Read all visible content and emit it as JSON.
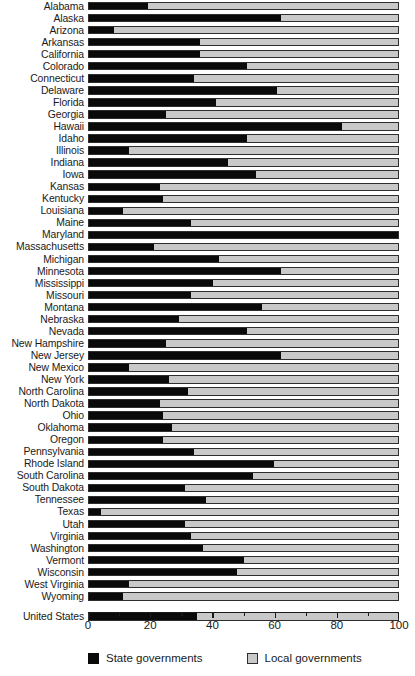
{
  "chart_data": {
    "type": "bar",
    "subtype": "stacked-horizontal-100percent",
    "title": "",
    "xlabel": "",
    "ylabel": "",
    "xlim": [
      0,
      100
    ],
    "xticks": [
      0,
      20,
      40,
      60,
      80,
      100
    ],
    "xticklabels": [
      "0",
      "20",
      "40",
      "60",
      "80",
      "100"
    ],
    "minor_ticks": [
      10,
      30,
      50,
      70,
      90
    ],
    "grid": false,
    "legend_position": "bottom",
    "categories": [
      "Alabama",
      "Alaska",
      "Arizona",
      "Arkansas",
      "California",
      "Colorado",
      "Connecticut",
      "Delaware",
      "Florida",
      "Georgia",
      "Hawaii",
      "Idaho",
      "Illinois",
      "Indiana",
      "Iowa",
      "Kansas",
      "Kentucky",
      "Louisiana",
      "Maine",
      "Maryland",
      "Massachusetts",
      "Michigan",
      "Minnesota",
      "Mississippi",
      "Missouri",
      "Montana",
      "Nebraska",
      "Nevada",
      "New Hampshire",
      "New Jersey",
      "New Mexico",
      "New York",
      "North Carolina",
      "North Dakota",
      "Ohio",
      "Oklahoma",
      "Oregon",
      "Pennsylvania",
      "Rhode Island",
      "South Carolina",
      "South Dakota",
      "Tennessee",
      "Texas",
      "Utah",
      "Virginia",
      "Washington",
      "Vermont",
      "Wisconsin",
      "West Virginia",
      "Wyoming",
      "United States"
    ],
    "series": [
      {
        "name": "State governments",
        "color": "#0a0a0a",
        "values": [
          19,
          62,
          8,
          36,
          36,
          51,
          34,
          61,
          41,
          25,
          82,
          51,
          13,
          45,
          54,
          23,
          24,
          11,
          33,
          100,
          21,
          42,
          62,
          40,
          33,
          56,
          29,
          51,
          25,
          62,
          13,
          26,
          32,
          23,
          24,
          27,
          24,
          34,
          60,
          53,
          31,
          38,
          4,
          31,
          33,
          37,
          50,
          48,
          13,
          11,
          35
        ]
      },
      {
        "name": "Local governments",
        "color": "#c9c9c9",
        "values": [
          81,
          38,
          92,
          64,
          64,
          49,
          66,
          39,
          59,
          75,
          18,
          49,
          87,
          55,
          46,
          77,
          76,
          89,
          67,
          0,
          79,
          58,
          38,
          60,
          67,
          44,
          71,
          49,
          75,
          38,
          87,
          74,
          68,
          77,
          76,
          73,
          76,
          66,
          40,
          47,
          69,
          62,
          96,
          69,
          67,
          63,
          50,
          52,
          87,
          89,
          65
        ]
      }
    ],
    "separator_before": "United States"
  },
  "legend": {
    "items": [
      {
        "label": "State governments",
        "swatch": "state"
      },
      {
        "label": "Local governments",
        "swatch": "local"
      }
    ]
  }
}
